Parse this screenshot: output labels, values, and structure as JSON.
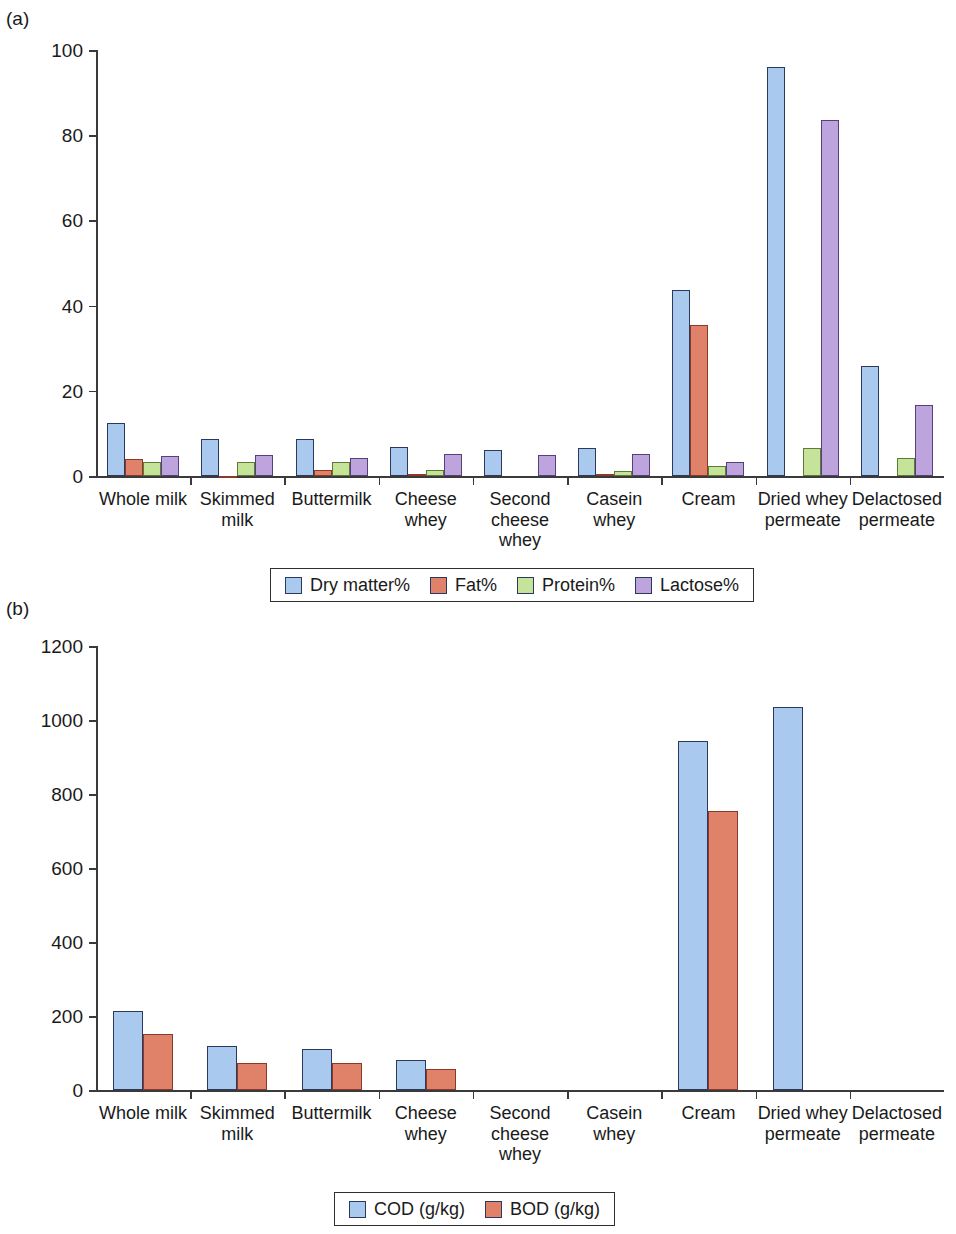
{
  "panels": {
    "a": {
      "tag": "(a)",
      "yticks": [
        "0",
        "20",
        "40",
        "60",
        "80",
        "100"
      ],
      "legend": [
        {
          "label": "Dry matter%",
          "color": "#a9caee"
        },
        {
          "label": "Fat%",
          "color": "#e0816a"
        },
        {
          "label": "Protein%",
          "color": "#c6e39a"
        },
        {
          "label": "Lactose%",
          "color": "#bda4dd"
        }
      ]
    },
    "b": {
      "tag": "(b)",
      "yticks": [
        "0",
        "200",
        "400",
        "600",
        "800",
        "1000",
        "1200"
      ],
      "legend": [
        {
          "label": "COD (g/kg)",
          "color": "#a9caee"
        },
        {
          "label": "BOD (g/kg)",
          "color": "#e0816a"
        }
      ]
    }
  },
  "chart_data": [
    {
      "type": "bar",
      "panel": "(a)",
      "title": "",
      "xlabel": "",
      "ylabel": "",
      "ylim": [
        0,
        100
      ],
      "yticks": [
        0,
        20,
        40,
        60,
        80,
        100
      ],
      "grid": false,
      "legend_position": "bottom",
      "categories": [
        "Whole milk",
        "Skimmed milk",
        "Buttermilk",
        "Cheese whey",
        "Second cheese whey",
        "Casein whey",
        "Cream",
        "Dried whey permeate",
        "Delactosed permeate"
      ],
      "category_lines": [
        [
          "Whole milk"
        ],
        [
          "Skimmed",
          "milk"
        ],
        [
          "Buttermilk"
        ],
        [
          "Cheese",
          "whey"
        ],
        [
          "Second",
          "cheese",
          "whey"
        ],
        [
          "Casein",
          "whey"
        ],
        [
          "Cream"
        ],
        [
          "Dried whey",
          "permeate"
        ],
        [
          "Delactosed",
          "permeate"
        ]
      ],
      "series": [
        {
          "name": "Dry matter%",
          "color": "#a9caee",
          "values": [
            12.5,
            8.8,
            8.6,
            6.8,
            6.2,
            6.5,
            43.6,
            96.0,
            25.8
          ]
        },
        {
          "name": "Fat%",
          "color": "#e0816a",
          "values": [
            3.9,
            0.1,
            1.3,
            0.4,
            0.0,
            0.5,
            35.5,
            0.0,
            0.0
          ]
        },
        {
          "name": "Protein%",
          "color": "#c6e39a",
          "values": [
            3.3,
            3.4,
            3.2,
            1.3,
            0.0,
            1.1,
            2.3,
            6.5,
            4.2
          ]
        },
        {
          "name": "Lactose%",
          "color": "#bda4dd",
          "values": [
            4.7,
            4.9,
            4.2,
            5.1,
            4.9,
            5.2,
            3.4,
            83.5,
            16.6
          ]
        }
      ]
    },
    {
      "type": "bar",
      "panel": "(b)",
      "title": "",
      "xlabel": "",
      "ylabel": "",
      "ylim": [
        0,
        1200
      ],
      "yticks": [
        0,
        200,
        400,
        600,
        800,
        1000,
        1200
      ],
      "grid": false,
      "legend_position": "bottom",
      "categories": [
        "Whole milk",
        "Skimmed milk",
        "Buttermilk",
        "Cheese whey",
        "Second cheese whey",
        "Casein whey",
        "Cream",
        "Dried whey permeate",
        "Delactosed permeate"
      ],
      "category_lines": [
        [
          "Whole milk"
        ],
        [
          "Skimmed",
          "milk"
        ],
        [
          "Buttermilk"
        ],
        [
          "Cheese",
          "whey"
        ],
        [
          "Second",
          "cheese",
          "whey"
        ],
        [
          "Casein",
          "whey"
        ],
        [
          "Cream"
        ],
        [
          "Dried whey",
          "permeate"
        ],
        [
          "Delactosed",
          "permeate"
        ]
      ],
      "series": [
        {
          "name": "COD (g/kg)",
          "color": "#a9caee",
          "values": [
            213,
            118,
            110,
            82,
            0,
            0,
            942,
            1036,
            0
          ]
        },
        {
          "name": "BOD (g/kg)",
          "color": "#e0816a",
          "values": [
            152,
            73,
            73,
            57,
            0,
            0,
            753,
            0,
            0
          ]
        }
      ]
    }
  ]
}
